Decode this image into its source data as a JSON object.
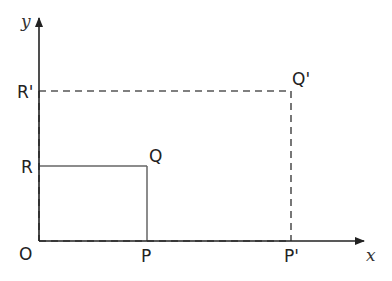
{
  "diagram": {
    "type": "coordinate-scaling",
    "axes": {
      "x_label": "x",
      "y_label": "y"
    },
    "points": {
      "origin": "O",
      "P": "P",
      "Q": "Q",
      "R": "R",
      "P_prime": "P'",
      "Q_prime": "Q'",
      "R_prime": "R'"
    },
    "shapes": [
      {
        "name": "rectangle OPQR",
        "style": "solid",
        "vertices": [
          "O",
          "P",
          "Q",
          "R"
        ]
      },
      {
        "name": "rectangle OP'Q'R'",
        "style": "dashed",
        "vertices": [
          "O",
          "P'",
          "Q'",
          "R'"
        ]
      }
    ],
    "colors": {
      "solid_line": "#555555",
      "dashed_line": "#555555",
      "axis": "#222222"
    }
  }
}
